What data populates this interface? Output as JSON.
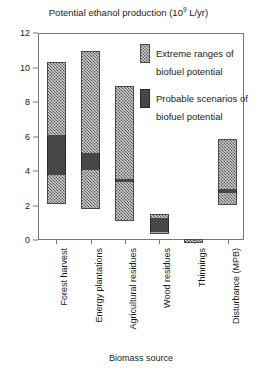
{
  "chart_data": {
    "type": "bar",
    "title_main": "Potential ethanol production (10",
    "title_exponent": "9",
    "title_tail": " L/yr)",
    "xlabel": "Biomass source",
    "ylabel": "",
    "ylim": [
      0,
      12
    ],
    "yticks": [
      0,
      2,
      4,
      6,
      8,
      10,
      12
    ],
    "ytick_labels": [
      "0",
      "2",
      "4",
      "6",
      "8",
      "10",
      "12"
    ],
    "grid": false,
    "legend_position": "upper right",
    "legend": [
      {
        "key": "extreme",
        "label": "Extreme ranges of biofuel potential",
        "line1": "Extreme ranges of",
        "line2": "biofuel potential",
        "color": "#8e8e8e"
      },
      {
        "key": "probable",
        "label": "Probable scenarios of biofuel potential",
        "line1": "Probable scenarios of",
        "line2": "biofuel potential",
        "color": "#3a3a3a"
      }
    ],
    "categories": [
      "Forest harvest",
      "Energy plantations",
      "Agricultural residues",
      "Wood residues",
      "Thinnings",
      "Disturbance (MPB)"
    ],
    "series": [
      {
        "name": "Extreme ranges of biofuel potential",
        "type": "range",
        "low": [
          2.25,
          1.95,
          1.3,
          0.5,
          0.0,
          2.2
        ],
        "high": [
          10.4,
          11.0,
          9.0,
          1.55,
          0.12,
          5.9
        ]
      },
      {
        "name": "Probable scenarios of biofuel potential",
        "type": "range",
        "low": [
          3.85,
          4.1,
          3.4,
          0.5,
          null,
          2.8
        ],
        "high": [
          6.15,
          5.1,
          3.6,
          1.35,
          null,
          3.0
        ]
      }
    ],
    "bars": [
      {
        "category": "Forest harvest",
        "extreme_low": 2.25,
        "extreme_high": 10.4,
        "probable_low": 3.85,
        "probable_high": 6.15
      },
      {
        "category": "Energy plantations",
        "extreme_low": 1.95,
        "extreme_high": 11.0,
        "probable_low": 4.1,
        "probable_high": 5.1
      },
      {
        "category": "Agricultural residues",
        "extreme_low": 1.3,
        "extreme_high": 9.0,
        "probable_low": 3.4,
        "probable_high": 3.6
      },
      {
        "category": "Wood residues",
        "extreme_low": 0.5,
        "extreme_high": 1.55,
        "probable_low": 0.5,
        "probable_high": 1.35
      },
      {
        "category": "Thinnings",
        "extreme_low": 0.0,
        "extreme_high": 0.12,
        "probable_low": null,
        "probable_high": null
      },
      {
        "category": "Disturbance (MPB)",
        "extreme_low": 2.2,
        "extreme_high": 5.9,
        "probable_low": 2.8,
        "probable_high": 3.0
      }
    ]
  }
}
